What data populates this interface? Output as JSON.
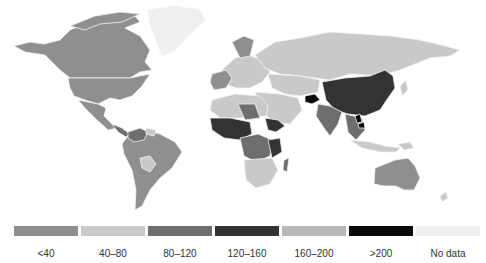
{
  "map": {
    "title": "",
    "type": "choropleth world map (grayscale)",
    "legend": [
      {
        "label": "<40",
        "class": "c-lt40",
        "color": "#8f8f8f"
      },
      {
        "label": "40–80",
        "class": "c-40-80",
        "color": "#c9c9c9"
      },
      {
        "label": "80–120",
        "class": "c-80-120",
        "color": "#6e6e6e"
      },
      {
        "label": "120–160",
        "class": "c-120-160",
        "color": "#333333"
      },
      {
        "label": "160–200",
        "class": "c-160-200",
        "color": "#b9b9b9"
      },
      {
        "label": ">200",
        "class": "c-gt200",
        "color": "#080808"
      },
      {
        "label": "No data",
        "class": "c-nodata",
        "color": "#efefef"
      }
    ],
    "regions": [
      {
        "name": "North America (Canada, USA)",
        "category": "<40"
      },
      {
        "name": "Greenland",
        "category": "No data"
      },
      {
        "name": "Mexico / Central America",
        "category": "<40"
      },
      {
        "name": "South America (most)",
        "category": "<40"
      },
      {
        "name": "Bolivia",
        "category": "40–80"
      },
      {
        "name": "Europe",
        "category": "mixed <40 / 40–80"
      },
      {
        "name": "Russia / Central Asia",
        "category": "40–80"
      },
      {
        "name": "China",
        "category": "120–160"
      },
      {
        "name": "India",
        "category": "80–120"
      },
      {
        "name": "Afghanistan",
        "category": ">200"
      },
      {
        "name": "North Africa",
        "category": "40–80 / 80–120"
      },
      {
        "name": "West & Central Africa",
        "category": "120–160 / >200"
      },
      {
        "name": "Southern Africa",
        "category": "40–80"
      },
      {
        "name": "Southeast Asia",
        "category": "80–120 / >200"
      },
      {
        "name": "Australia",
        "category": "<40"
      }
    ]
  }
}
